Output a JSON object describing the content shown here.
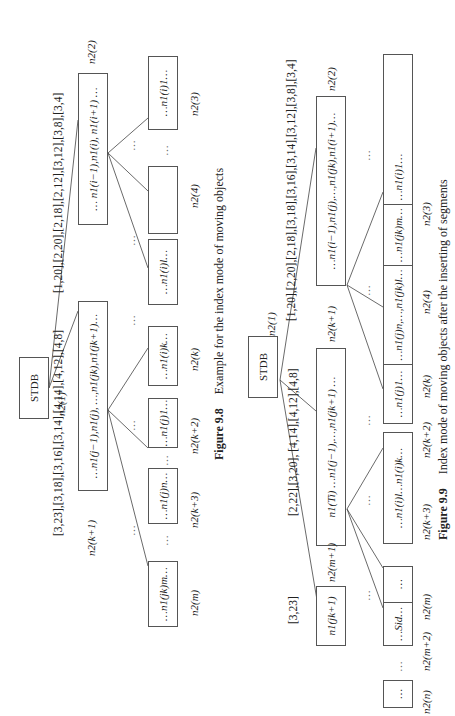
{
  "orientation": "rotated-90-ccw",
  "figure_9_8": {
    "caption_number": "Figure 9.8",
    "caption_text": "Example for the index mode of moving objects",
    "root": {
      "label": "STDB",
      "node_id": "n2(1)"
    },
    "left_interval": "[1,20],[2,20],[2,18],[2,12],[3,12],[3,8],[3,4]",
    "right_interval": "[3,23],[3,18],[3,16],[3,14],[4,14],[4,12],[4,8]",
    "level1": [
      {
        "node_id": "n2(2)",
        "content": "… n1(i−1),n1(i), n1(i+1) …"
      },
      {
        "node_id": "n2(k+1)",
        "content": "…n1(j−1),n1(j), …,n1(jk),n1(jk+1)…"
      }
    ],
    "leaves": [
      {
        "node_id": "n2(3)",
        "content": "…n1(i)1…"
      },
      {
        "node_id": "n2(4)",
        "content": "…n1(i)l…"
      },
      {
        "node_id": "n2(k)",
        "content": "…n1(i)k…"
      },
      {
        "node_id": "n2(k+2)",
        "content": "…n1(j)1…"
      },
      {
        "node_id": "n2(k+3)",
        "content": "…n1(j)n…"
      },
      {
        "node_id": "n2(m)",
        "content": "…n1(jk)m…"
      }
    ],
    "ellipsis": "…",
    "vdots": "⋮"
  },
  "figure_9_9": {
    "caption_number": "Figure 9.9",
    "caption_text": "Index mode of moving objects after the inserting of segments",
    "root": {
      "label": "STDB",
      "node_id": "n2(1)"
    },
    "left_interval": "[1,20],[2,20],[2,18],[3,18],[3,16],[3,14],[3,12],[3,8],[3,4]",
    "middle_interval": "[2,22],[3,20], [4,14],[4,12],[4,8]",
    "right_interval": "[3,23]",
    "level1": [
      {
        "node_id": "n2(2)",
        "content": "…n1(i−1),n1(j),…,n1(jk),n1(i+1)…"
      },
      {
        "node_id": "n2(k+1)",
        "content": "n1(Ti) …n1(j−1),…,n1(jk+1) …"
      },
      {
        "node_id": "n2(m+1)",
        "content": "n1(jk+1)"
      }
    ],
    "leaves": [
      {
        "node_id": "n2(3)",
        "content": "…n1(j)1…"
      },
      {
        "node_id": "n2(4)",
        "content": "…n1(j)n,…,n1(jk)l…"
      },
      {
        "node_id": "n2(k)",
        "content": "…n1(jk)m…"
      },
      {
        "node_id": "n2(k+2)",
        "content": "…n1(i)1…"
      },
      {
        "node_id": "n2(k+3)",
        "content": "…n1(i)l…n1(i)k…"
      },
      {
        "node_id": "n2(m)",
        "content": "…Sid…"
      },
      {
        "node_id": "n2(m+2)",
        "content": "…"
      },
      {
        "node_id": "n2(n)",
        "content": "…"
      }
    ],
    "ellipsis": "…",
    "vdots": "⋮"
  }
}
